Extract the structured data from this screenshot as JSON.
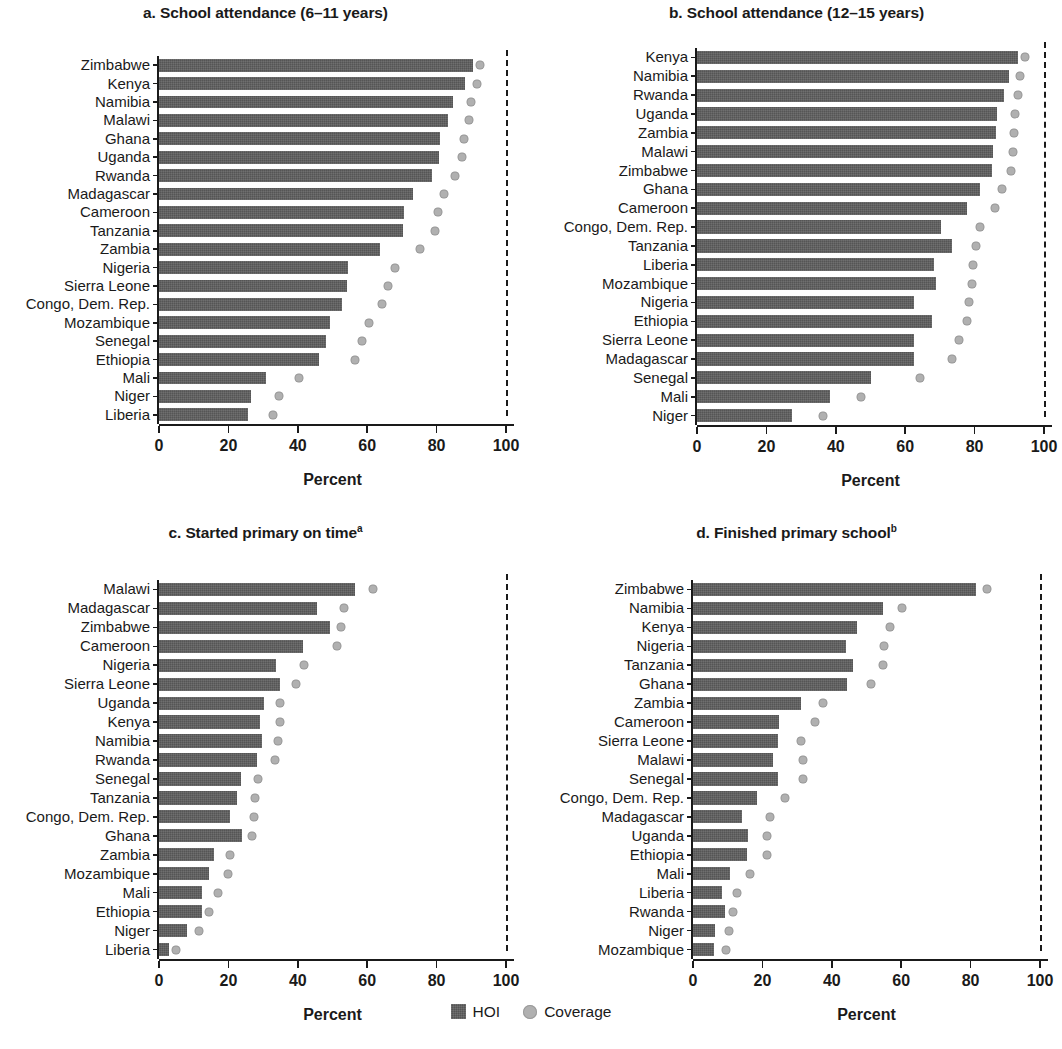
{
  "figure": {
    "background": "#ffffff",
    "bar_color": "#5f5f5f",
    "dot_color": "#b0b0b0",
    "axis_color": "#1a1a1a"
  },
  "legend": {
    "position": "bottom-center",
    "items": [
      {
        "key": "hoi",
        "label": "HOI",
        "marker": "square",
        "color": "#5f5f5f"
      },
      {
        "key": "coverage",
        "label": "Coverage",
        "marker": "circle",
        "color": "#b0b0b0"
      }
    ]
  },
  "axis": {
    "xlabel": "Percent",
    "ticks": [
      "0",
      "20",
      "40",
      "60",
      "80",
      "100"
    ],
    "xlim": [
      0,
      100
    ],
    "reference_value": 100
  },
  "chart_data": [
    {
      "id": "a",
      "type": "bar",
      "orientation": "horizontal",
      "title": "a. School attendance (6–11 years)",
      "title_prefix": "a. School attendance (6–11 years)",
      "title_sup": "",
      "xlabel": "Percent",
      "ylabel": "",
      "xlim": [
        0,
        100
      ],
      "xticks": [
        0,
        20,
        40,
        60,
        80,
        100
      ],
      "grid": false,
      "legend": [
        "HOI",
        "Coverage"
      ],
      "categories": [
        "Zimbabwe",
        "Kenya",
        "Namibia",
        "Malawi",
        "Ghana",
        "Uganda",
        "Rwanda",
        "Madagascar",
        "Cameroon",
        "Tanzania",
        "Zambia",
        "Nigeria",
        "Sierra Leone",
        "Congo, Dem. Rep.",
        "Mozambique",
        "Senegal",
        "Ethiopia",
        "Mali",
        "Niger",
        "Liberia"
      ],
      "series": [
        {
          "name": "HOI",
          "values": [
            90.6,
            88.3,
            84.8,
            83.4,
            81.0,
            80.6,
            78.8,
            73.3,
            70.6,
            70.4,
            63.8,
            54.6,
            54.2,
            52.8,
            49.4,
            48.0,
            46.2,
            30.8,
            26.6,
            25.6
          ]
        },
        {
          "name": "Coverage",
          "values": [
            92.5,
            91.6,
            90.0,
            89.2,
            88.0,
            87.2,
            85.4,
            82.0,
            80.4,
            79.6,
            75.2,
            68.0,
            66.0,
            64.4,
            60.6,
            58.4,
            56.6,
            40.4,
            34.6,
            32.8
          ]
        }
      ]
    },
    {
      "id": "b",
      "type": "bar",
      "orientation": "horizontal",
      "title": "b. School attendance (12–15 years)",
      "title_prefix": "b. School attendance (12–15 years)",
      "title_sup": "",
      "xlabel": "Percent",
      "ylabel": "",
      "xlim": [
        0,
        100
      ],
      "xticks": [
        0,
        20,
        40,
        60,
        80,
        100
      ],
      "grid": false,
      "legend": [
        "HOI",
        "Coverage"
      ],
      "categories": [
        "Kenya",
        "Namibia",
        "Rwanda",
        "Uganda",
        "Zambia",
        "Malawi",
        "Zimbabwe",
        "Ghana",
        "Cameroon",
        "Congo, Dem. Rep.",
        "Tanzania",
        "Liberia",
        "Mozambique",
        "Nigeria",
        "Ethiopia",
        "Sierra Leone",
        "Madagascar",
        "Senegal",
        "Mali",
        "Niger"
      ],
      "series": [
        {
          "name": "HOI",
          "values": [
            92.4,
            89.8,
            88.6,
            86.4,
            86.2,
            85.4,
            85.0,
            81.6,
            77.8,
            70.4,
            73.6,
            68.4,
            69.0,
            62.4,
            67.8,
            62.6,
            62.4,
            50.2,
            38.4,
            27.4
          ]
        },
        {
          "name": "Coverage",
          "values": [
            94.4,
            93.2,
            92.6,
            91.6,
            91.4,
            91.0,
            90.4,
            88.0,
            85.8,
            81.6,
            80.4,
            79.6,
            79.2,
            78.4,
            77.8,
            75.4,
            73.6,
            64.2,
            47.2,
            36.4
          ]
        }
      ]
    },
    {
      "id": "c",
      "type": "bar",
      "orientation": "horizontal",
      "title": "c. Started primary on time",
      "title_prefix": "c. Started primary on time",
      "title_sup": "a",
      "xlabel": "Percent",
      "ylabel": "",
      "xlim": [
        0,
        100
      ],
      "xticks": [
        0,
        20,
        40,
        60,
        80,
        100
      ],
      "grid": false,
      "legend": [
        "HOI",
        "Coverage"
      ],
      "categories": [
        "Malawi",
        "Madagascar",
        "Zimbabwe",
        "Cameroon",
        "Nigeria",
        "Sierra Leone",
        "Uganda",
        "Kenya",
        "Namibia",
        "Rwanda",
        "Senegal",
        "Tanzania",
        "Congo, Dem. Rep.",
        "Ghana",
        "Zambia",
        "Mozambique",
        "Mali",
        "Ethiopia",
        "Niger",
        "Liberia"
      ],
      "series": [
        {
          "name": "HOI",
          "values": [
            56.4,
            45.6,
            49.2,
            41.6,
            33.6,
            35.0,
            30.4,
            29.0,
            29.6,
            28.2,
            23.6,
            22.4,
            20.6,
            23.8,
            15.8,
            14.4,
            12.4,
            12.4,
            8.0,
            3.0
          ]
        },
        {
          "name": "Coverage",
          "values": [
            61.8,
            53.4,
            52.4,
            51.4,
            41.8,
            39.6,
            35.0,
            34.8,
            34.2,
            33.4,
            28.6,
            27.6,
            27.4,
            26.8,
            20.4,
            20.0,
            17.0,
            14.4,
            11.4,
            5.0
          ]
        }
      ]
    },
    {
      "id": "d",
      "type": "bar",
      "orientation": "horizontal",
      "title": "d. Finished primary school",
      "title_prefix": "d. Finished primary school",
      "title_sup": "b",
      "xlabel": "Percent",
      "ylabel": "",
      "xlim": [
        0,
        100
      ],
      "xticks": [
        0,
        20,
        40,
        60,
        80,
        100
      ],
      "grid": false,
      "legend": [
        "HOI",
        "Coverage"
      ],
      "categories": [
        "Zimbabwe",
        "Namibia",
        "Kenya",
        "Nigeria",
        "Tanzania",
        "Ghana",
        "Zambia",
        "Cameroon",
        "Sierra Leone",
        "Malawi",
        "Senegal",
        "Congo, Dem. Rep.",
        "Madagascar",
        "Uganda",
        "Ethiopia",
        "Mali",
        "Liberia",
        "Rwanda",
        "Niger",
        "Mozambique"
      ],
      "series": [
        {
          "name": "HOI",
          "values": [
            81.6,
            54.8,
            47.4,
            44.0,
            46.2,
            44.4,
            31.2,
            24.8,
            24.4,
            23.0,
            24.4,
            18.4,
            14.2,
            15.8,
            15.6,
            10.6,
            8.4,
            9.2,
            6.4,
            6.0
          ]
        },
        {
          "name": "Coverage",
          "values": [
            84.8,
            60.2,
            56.8,
            55.0,
            54.8,
            51.2,
            37.6,
            35.2,
            31.2,
            31.6,
            31.8,
            26.4,
            22.2,
            21.4,
            21.2,
            16.4,
            12.8,
            11.6,
            10.4,
            9.6
          ]
        }
      ]
    }
  ]
}
